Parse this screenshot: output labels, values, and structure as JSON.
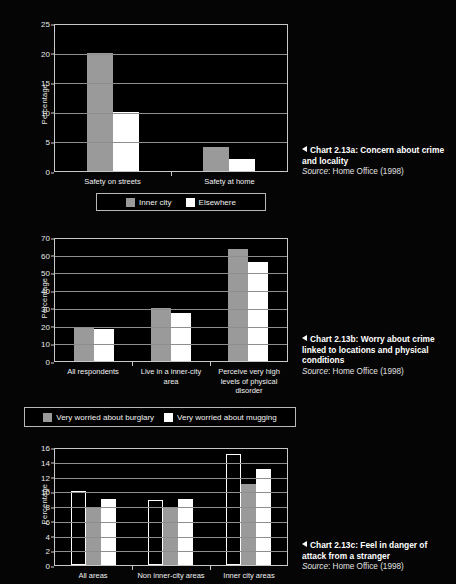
{
  "page": {
    "background": "#000000",
    "bar_gray": "#9a9a9a",
    "bar_white": "#ffffff",
    "bar_black": "#000000"
  },
  "charts": [
    {
      "id": "chart-2-13a",
      "ylabel": "Percentage",
      "yticks": [
        "0",
        "5",
        "10",
        "15",
        "20",
        "25"
      ],
      "categories": [
        "Safety on streets",
        "Safety at home"
      ],
      "legend": [
        {
          "label": "Inner city",
          "swatch": "gray"
        },
        {
          "label": "Elsewhere",
          "swatch": "white"
        }
      ],
      "caption_title": "Chart 2.13a: Concern about crime and locality",
      "caption_source_prefix": "Source",
      "caption_source_rest": ": Home Office (1998)"
    },
    {
      "id": "chart-2-13b",
      "ylabel": "Percentage",
      "yticks": [
        "0",
        "10",
        "20",
        "30",
        "40",
        "50",
        "60",
        "70"
      ],
      "categories": [
        "All respondents",
        "Live in a inner-city area",
        "Perceive very high levels of physical disorder"
      ],
      "legend": [
        {
          "label": "Very worried about burglary",
          "swatch": "gray"
        },
        {
          "label": "Very worried about mugging",
          "swatch": "white"
        }
      ],
      "caption_title": "Chart 2.13b: Worry about crime linked to locations and physical conditions",
      "caption_source_prefix": "Source",
      "caption_source_rest": ": Home Office (1998)"
    },
    {
      "id": "chart-2-13c",
      "ylabel": "Percentage",
      "yticks": [
        "0",
        "2",
        "4",
        "6",
        "8",
        "10",
        "12",
        "14",
        "16"
      ],
      "categories": [
        "All areas",
        "Non inner-city areas",
        "Inner city areas"
      ],
      "legend": [],
      "caption_title": "Chart 2.13c: Feel in danger of attack from a stranger",
      "caption_source_prefix": "Source",
      "caption_source_rest": ": Home Office (1998)"
    }
  ],
  "chart_data": [
    {
      "type": "bar",
      "title": "Chart 2.13a: Concern about crime and locality",
      "source": "Home Office (1998)",
      "xlabel": "",
      "ylabel": "Percentage",
      "ylim": [
        0,
        25
      ],
      "ytick_step": 5,
      "grid": true,
      "legend_position": "bottom",
      "categories": [
        "Safety on streets",
        "Safety at home"
      ],
      "series": [
        {
          "name": "Inner city",
          "color": "#9a9a9a",
          "values": [
            20,
            4
          ]
        },
        {
          "name": "Elsewhere",
          "color": "#ffffff",
          "values": [
            10,
            2
          ]
        }
      ]
    },
    {
      "type": "bar",
      "title": "Chart 2.13b: Worry about crime linked to locations and physical conditions",
      "source": "Home Office (1998)",
      "xlabel": "",
      "ylabel": "Percentage",
      "ylim": [
        0,
        70
      ],
      "ytick_step": 10,
      "grid": true,
      "legend_position": "bottom",
      "categories": [
        "All respondents",
        "Live in a inner-city area",
        "Perceive very high levels of physical disorder"
      ],
      "series": [
        {
          "name": "Very worried about burglary",
          "color": "#9a9a9a",
          "values": [
            19,
            30,
            63
          ]
        },
        {
          "name": "Very worried about mugging",
          "color": "#ffffff",
          "values": [
            18,
            27,
            56
          ]
        }
      ]
    },
    {
      "type": "bar",
      "title": "Chart 2.13c: Feel in danger of attack from a stranger",
      "source": "Home Office (1998)",
      "xlabel": "",
      "ylabel": "Percentage",
      "ylim": [
        0,
        16
      ],
      "ytick_step": 2,
      "grid": true,
      "legend_position": "none",
      "categories": [
        "All areas",
        "Non inner-city areas",
        "Inner city areas"
      ],
      "series": [
        {
          "name": "Series 1",
          "color": "#000000",
          "values": [
            10,
            8.8,
            15
          ]
        },
        {
          "name": "Series 2",
          "color": "#9a9a9a",
          "values": [
            7.9,
            7.9,
            11
          ]
        },
        {
          "name": "Series 3",
          "color": "#ffffff",
          "values": [
            8.9,
            8.9,
            13
          ]
        }
      ]
    }
  ]
}
